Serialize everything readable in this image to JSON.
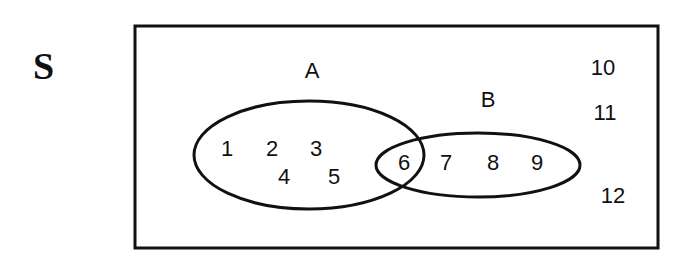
{
  "universe": {
    "label": "S",
    "elements_outside": [
      "10",
      "11",
      "12"
    ]
  },
  "sets": [
    {
      "name": "A",
      "label": "A",
      "only_elements": [
        "1",
        "2",
        "3",
        "4",
        "5"
      ]
    },
    {
      "name": "B",
      "label": "B",
      "only_elements": [
        "7",
        "8",
        "9"
      ]
    }
  ],
  "intersection": {
    "label": "A∩B",
    "elements": [
      "6"
    ]
  },
  "text": {
    "s": "S",
    "a": "A",
    "b": "B",
    "n1": "1",
    "n2": "2",
    "n3": "3",
    "n4": "4",
    "n5": "5",
    "n6": "6",
    "n7": "7",
    "n8": "8",
    "n9": "9",
    "n10": "10",
    "n11": "11",
    "n12": "12"
  },
  "colors": {
    "stroke": "#111111",
    "background": "#ffffff"
  }
}
